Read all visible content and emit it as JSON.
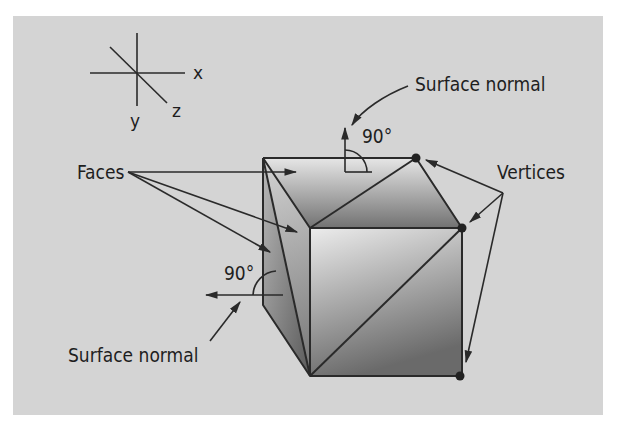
{
  "diagram": {
    "axes": {
      "x_label": "x",
      "y_label": "y",
      "z_label": "z"
    },
    "labels": {
      "faces": "Faces",
      "vertices": "Vertices",
      "surface_normal_top": "Surface normal",
      "surface_normal_left": "Surface normal",
      "angle_top": "90°",
      "angle_left": "90°"
    },
    "colors": {
      "background": "#d4d4d4",
      "line": "#2a2a2a",
      "face_light": "#e8e8e8",
      "face_dark": "#6e6e6e",
      "vertex": "#222222"
    }
  }
}
